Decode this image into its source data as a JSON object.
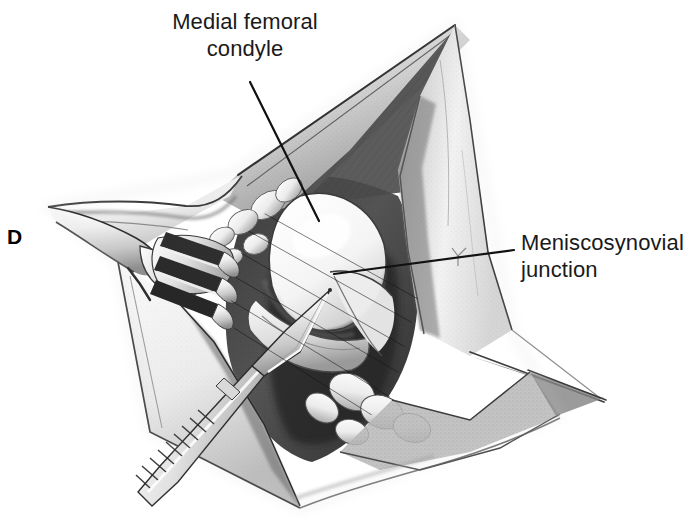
{
  "figure": {
    "panel_letter": "D",
    "background_color": "#ffffff",
    "ink_color": "#1a1a1a",
    "style": "pen-and-ink stipple medical illustration"
  },
  "labels": {
    "condyle": {
      "line1": "Medial femoral",
      "line2": "condyle"
    },
    "meniscosynovial": {
      "line1": "Meniscosynovial",
      "line2": "junction"
    }
  },
  "leader_lines": {
    "condyle": {
      "x1": 250,
      "y1": 82,
      "x2": 319,
      "y2": 221
    },
    "meniscosynovial": {
      "x1": 334,
      "y1": 274,
      "x2": 514,
      "y2": 250
    }
  },
  "instruments": {
    "retractor": "three-prong rake retractor",
    "scalpel": "scalpel with knurled handle"
  },
  "anatomy": [
    "medial femoral condyle",
    "meniscosynovial junction",
    "retracted capsular flap",
    "joint space"
  ]
}
